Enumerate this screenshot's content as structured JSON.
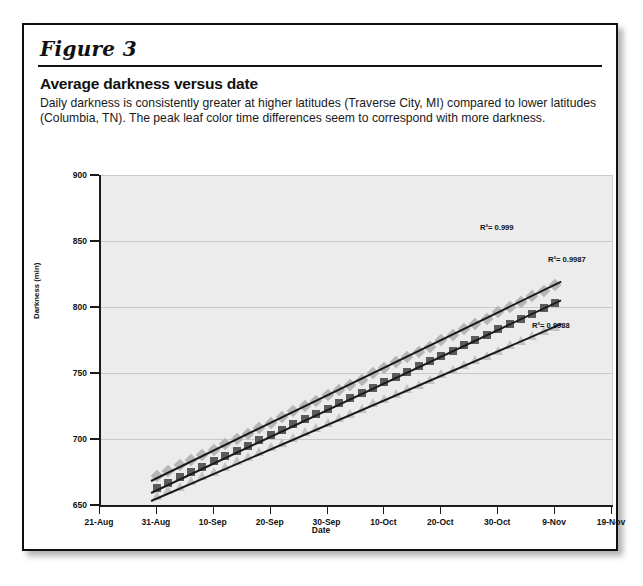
{
  "figure": {
    "label": "Figure 3",
    "title": "Average darkness versus date",
    "description": "Daily darkness is consistently greater at higher latitudes (Traverse City, MI) compared to lower latitudes (Columbia, TN). The peak leaf color time differences seem to correspond with more darkness."
  },
  "chart_data": {
    "type": "scatter",
    "title": "Average darkness versus date",
    "xlabel": "Date",
    "ylabel": "Darkness (min)",
    "ylim": [
      650,
      900
    ],
    "yticks": [
      650,
      700,
      750,
      800,
      850,
      900
    ],
    "xticks": [
      "21-Aug",
      "31-Aug",
      "10-Sep",
      "20-Sep",
      "30-Sep",
      "10-Oct",
      "20-Oct",
      "30-Oct",
      "9-Nov",
      "19-Nov"
    ],
    "xlim_days": [
      0,
      90
    ],
    "grid": true,
    "legend_position": "bottom-right",
    "series": [
      {
        "name": "Traverse City, MI",
        "latitude": "(44.45 N)",
        "marker": "diamond",
        "color": "#b6b6b6",
        "r2_label": "R²= 0.999",
        "x_days": [
          10,
          12,
          14,
          16,
          18,
          20,
          22,
          24,
          26,
          28,
          30,
          32,
          34,
          36,
          38,
          40,
          42,
          44,
          46,
          48,
          50,
          52,
          54,
          56,
          58,
          60,
          62,
          64,
          66,
          68,
          70,
          72,
          74,
          76,
          78,
          80
        ],
        "values": [
          672,
          676,
          680,
          684,
          688,
          692,
          696,
          700,
          704,
          708,
          712,
          717,
          721,
          725,
          729,
          733,
          737,
          741,
          745,
          750,
          754,
          758,
          762,
          766,
          770,
          775,
          779,
          783,
          787,
          791,
          796,
          800,
          804,
          808,
          812,
          817
        ]
      },
      {
        "name": "Grove City, OH",
        "latitude": "(39.51 N)",
        "marker": "square",
        "color": "#5b5b5b",
        "r2_label": "R²= 0.9987",
        "x_days": [
          10,
          12,
          14,
          16,
          18,
          20,
          22,
          24,
          26,
          28,
          30,
          32,
          34,
          36,
          38,
          40,
          42,
          44,
          46,
          48,
          50,
          52,
          54,
          56,
          58,
          60,
          62,
          64,
          66,
          68,
          70,
          72,
          74,
          76,
          78,
          80
        ],
        "values": [
          663,
          667,
          671,
          675,
          679,
          683,
          687,
          691,
          695,
          699,
          703,
          707,
          711,
          715,
          719,
          723,
          727,
          731,
          735,
          739,
          743,
          747,
          751,
          755,
          759,
          763,
          767,
          771,
          775,
          779,
          783,
          787,
          791,
          795,
          799,
          803
        ]
      },
      {
        "name": "Columbia, TN",
        "latitude": "(35.37 N)",
        "marker": "triangle",
        "color": "#c4c4c4",
        "r2_label": "R²= 0.9988",
        "x_days": [
          10,
          12,
          14,
          16,
          18,
          20,
          22,
          24,
          26,
          28,
          30,
          32,
          34,
          36,
          38,
          40,
          42,
          44,
          46,
          48,
          50,
          52,
          54,
          56,
          58,
          60,
          62,
          64,
          66,
          68,
          70,
          72,
          74,
          76,
          78,
          80
        ],
        "values": [
          657,
          661,
          664,
          668,
          672,
          675,
          679,
          683,
          686,
          690,
          694,
          697,
          701,
          705,
          708,
          712,
          716,
          719,
          723,
          727,
          730,
          734,
          738,
          741,
          745,
          749,
          752,
          756,
          760,
          763,
          767,
          771,
          774,
          778,
          782,
          785
        ]
      }
    ]
  }
}
